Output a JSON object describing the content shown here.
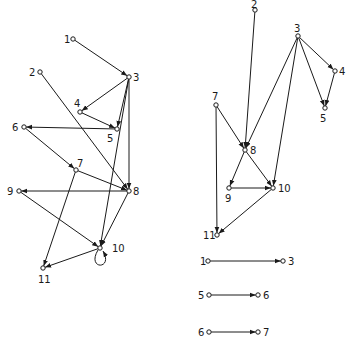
{
  "colors": {
    "ink": "#1a1a1a",
    "background": "#ffffff"
  },
  "left_graph": {
    "nodes": [
      {
        "id": "1",
        "x": 73,
        "y": 39,
        "lx": 64,
        "ly": 43
      },
      {
        "id": "2",
        "x": 40,
        "y": 72,
        "lx": 29,
        "ly": 76
      },
      {
        "id": "3",
        "x": 129,
        "y": 77,
        "lx": 133,
        "ly": 81
      },
      {
        "id": "4",
        "x": 80,
        "y": 112,
        "lx": 74,
        "ly": 107
      },
      {
        "id": "5",
        "x": 117,
        "y": 129,
        "lx": 107,
        "ly": 142
      },
      {
        "id": "6",
        "x": 24,
        "y": 127,
        "lx": 12,
        "ly": 131
      },
      {
        "id": "7",
        "x": 76,
        "y": 170,
        "lx": 77,
        "ly": 167
      },
      {
        "id": "8",
        "x": 129,
        "y": 191,
        "lx": 133,
        "ly": 195
      },
      {
        "id": "9",
        "x": 19,
        "y": 191,
        "lx": 7,
        "ly": 195
      },
      {
        "id": "10",
        "x": 100,
        "y": 248,
        "lx": 112,
        "ly": 252
      },
      {
        "id": "11",
        "x": 43,
        "y": 268,
        "lx": 38,
        "ly": 283
      }
    ],
    "edges": [
      [
        "1",
        "3"
      ],
      [
        "3",
        "4"
      ],
      [
        "4",
        "5"
      ],
      [
        "3",
        "5"
      ],
      [
        "5",
        "6"
      ],
      [
        "2",
        "8"
      ],
      [
        "3",
        "8"
      ],
      [
        "3",
        "10"
      ],
      [
        "6",
        "7"
      ],
      [
        "7",
        "8"
      ],
      [
        "8",
        "9"
      ],
      [
        "9",
        "10"
      ],
      [
        "8",
        "10"
      ],
      [
        "7",
        "11"
      ],
      [
        "10",
        "11"
      ]
    ],
    "self_loops": [
      "10"
    ]
  },
  "right_graph": {
    "nodes": [
      {
        "id": "2",
        "x": 255,
        "y": 10,
        "lx": 251,
        "ly": 8
      },
      {
        "id": "3",
        "x": 298,
        "y": 36,
        "lx": 294,
        "ly": 32
      },
      {
        "id": "4",
        "x": 335,
        "y": 71,
        "lx": 339,
        "ly": 75
      },
      {
        "id": "5",
        "x": 325,
        "y": 108,
        "lx": 320,
        "ly": 122
      },
      {
        "id": "7",
        "x": 216,
        "y": 105,
        "lx": 212,
        "ly": 100
      },
      {
        "id": "8",
        "x": 245,
        "y": 150,
        "lx": 250,
        "ly": 154
      },
      {
        "id": "9",
        "x": 229,
        "y": 188,
        "lx": 225,
        "ly": 202
      },
      {
        "id": "10",
        "x": 273,
        "y": 188,
        "lx": 278,
        "ly": 192
      },
      {
        "id": "11",
        "x": 217,
        "y": 235,
        "lx": 203,
        "ly": 239
      }
    ],
    "edges": [
      [
        "2",
        "8"
      ],
      [
        "3",
        "4"
      ],
      [
        "3",
        "5"
      ],
      [
        "4",
        "5"
      ],
      [
        "3",
        "8"
      ],
      [
        "3",
        "10"
      ],
      [
        "7",
        "8"
      ],
      [
        "7",
        "11"
      ],
      [
        "8",
        "9"
      ],
      [
        "8",
        "10"
      ],
      [
        "9",
        "10"
      ],
      [
        "10",
        "11"
      ]
    ]
  },
  "isolated_pairs": [
    {
      "from": "1",
      "to": "3",
      "y": 261,
      "x1": 208,
      "x2": 283,
      "lfrom_x": 200,
      "lto_x": 288
    },
    {
      "from": "5",
      "to": "6",
      "y": 295,
      "x1": 209,
      "x2": 258,
      "lfrom_x": 198,
      "lto_x": 263
    },
    {
      "from": "6",
      "to": "7",
      "y": 332,
      "x1": 209,
      "x2": 258,
      "lfrom_x": 198,
      "lto_x": 263
    }
  ]
}
